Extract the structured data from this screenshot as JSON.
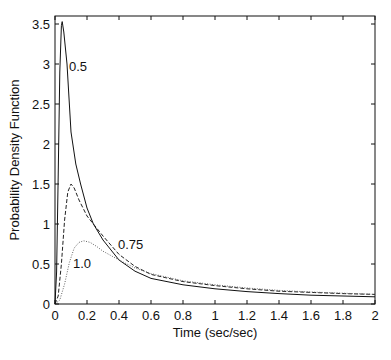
{
  "chart_data": {
    "type": "line",
    "title": "",
    "xlabel": "Time (sec/sec)",
    "ylabel": "Probability Density Function",
    "xlim": [
      0,
      2
    ],
    "ylim": [
      0,
      3.6
    ],
    "grid": false,
    "legend": "none (curves labeled inline)",
    "x_ticks": [
      "0",
      "0.2",
      "0.4",
      "0.6",
      "0.8",
      "1",
      "1.2",
      "1.4",
      "1.6",
      "1.8",
      "2"
    ],
    "y_ticks": [
      "0",
      "0.5",
      "1",
      "1.5",
      "2",
      "2.5",
      "3",
      "3.5"
    ],
    "series": [
      {
        "name": "0.5",
        "style": "solid",
        "x": [
          0,
          0.01,
          0.02,
          0.03,
          0.04,
          0.045,
          0.055,
          0.075,
          0.1,
          0.13,
          0.16,
          0.2,
          0.24,
          0.3,
          0.4,
          0.5,
          0.6,
          0.8,
          1.0,
          1.2,
          1.4,
          1.6,
          1.8,
          2.0
        ],
        "y": [
          0,
          0.4,
          1.6,
          2.9,
          3.48,
          3.53,
          3.4,
          3.0,
          2.15,
          1.75,
          1.5,
          1.2,
          1.0,
          0.8,
          0.55,
          0.41,
          0.32,
          0.24,
          0.19,
          0.155,
          0.13,
          0.11,
          0.1,
          0.09
        ]
      },
      {
        "name": "0.75",
        "style": "dashed",
        "x": [
          0,
          0.02,
          0.04,
          0.06,
          0.08,
          0.1,
          0.12,
          0.15,
          0.2,
          0.24,
          0.3,
          0.4,
          0.5,
          0.6,
          0.8,
          1.0,
          1.2,
          1.4,
          1.6,
          1.8,
          2.0
        ],
        "y": [
          0,
          0.1,
          0.5,
          1.05,
          1.4,
          1.5,
          1.45,
          1.3,
          1.1,
          1.0,
          0.85,
          0.62,
          0.47,
          0.37,
          0.28,
          0.23,
          0.19,
          0.16,
          0.145,
          0.13,
          0.12
        ]
      },
      {
        "name": "1.0",
        "style": "dotted",
        "x": [
          0,
          0.03,
          0.06,
          0.09,
          0.12,
          0.15,
          0.18,
          0.22,
          0.26,
          0.3,
          0.4,
          0.5,
          0.6,
          0.8,
          1.0,
          1.2,
          1.4,
          1.6,
          1.8,
          2.0
        ],
        "y": [
          0,
          0.05,
          0.25,
          0.52,
          0.7,
          0.77,
          0.79,
          0.77,
          0.72,
          0.66,
          0.55,
          0.45,
          0.38,
          0.29,
          0.24,
          0.2,
          0.17,
          0.15,
          0.135,
          0.12
        ]
      }
    ],
    "annotations": [
      {
        "text": "0.5",
        "x": 0.09,
        "y": 3.0
      },
      {
        "text": "0.75",
        "x": 0.4,
        "y": 0.72
      },
      {
        "text": "1.0",
        "x": 0.12,
        "y": 0.5
      }
    ]
  }
}
